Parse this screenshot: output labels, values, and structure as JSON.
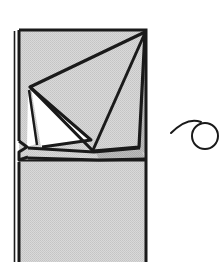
{
  "figure": {
    "title": "Folded sheet diagram with spiral motif",
    "background_color": "#ffffff",
    "line_color": "#1a1a1a",
    "fill_gray": "#d2d2d2",
    "fill_gray_dark": "#b9b9b9",
    "fill_white": "#ffffff",
    "canvas": {
      "width": 222,
      "height": 273
    }
  },
  "parts": {
    "sheet": {
      "name": "rectangular sheet",
      "label": "sheet-body",
      "outline_points": "19,30 146,30 146,262 19,262",
      "fill": "#d2d2d2"
    },
    "left_edge_strip": {
      "name": "left thin edge strip",
      "label": "left-edge-strip",
      "points": "14,30 19,30 19,262 14,262"
    },
    "notch": {
      "name": "left edge notch",
      "label": "edge-notch",
      "points": "19,140 26,146 19,153 19,163 26,158"
    },
    "big_triangle": {
      "name": "large folded triangular flap",
      "label": "large-flap",
      "points": "146,32 31,88 94,152 140,148",
      "fill": "#d2d2d2"
    },
    "shadow_band": {
      "name": "drop shadow under flap",
      "label": "flap-shadow",
      "fill": "#b9b9b9"
    },
    "white_triangle": {
      "name": "white inner fold triangle",
      "label": "inner-fold-white",
      "points": "31,89 88,137 40,146",
      "fill": "#ffffff"
    },
    "crease_lower": {
      "name": "lower crease band",
      "label": "lower-crease",
      "points": "26,148 140,148 146,158 26,160"
    },
    "horizon": {
      "name": "horizontal fold line across sheet",
      "label": "fold-horizon",
      "y": 160
    }
  },
  "spiral": {
    "name": "spiral loop motif",
    "label": "spiral-motif",
    "circle": {
      "cx": 205,
      "cy": 136,
      "r": 13
    },
    "tail_path": "M 172,132 C 180,124 192,119 205,123"
  }
}
